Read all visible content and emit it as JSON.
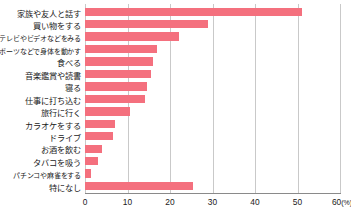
{
  "chart_data": {
    "type": "bar",
    "orientation": "horizontal",
    "title": "",
    "xlabel": "(%)",
    "ylabel": "",
    "xlim": [
      0,
      60
    ],
    "xticks": [
      0,
      10,
      20,
      30,
      40,
      50,
      60
    ],
    "xtick_labels": [
      "0",
      "10",
      "20",
      "30",
      "40",
      "50",
      "60"
    ],
    "unit_label": "(%)",
    "grid": true,
    "legend": false,
    "bar_color": "#F4707E",
    "gridline_color": "#C9C9C9",
    "axis_color": "#8A8A8A",
    "text_color": "#1A1A1A",
    "categories": [
      "家族や友人と話す",
      "買い物をする",
      "テレビやビデオなどをみる",
      "スポーツなどで身体を動かす",
      "食べる",
      "音楽鑑賞や読書",
      "寝る",
      "仕事に打ち込む",
      "旅行に行く",
      "カラオケをする",
      "ドライブ",
      "お酒を飲む",
      "タバコを吸う",
      "パチンコや麻雀をする",
      "特になし"
    ],
    "values": [
      51,
      29,
      22,
      17,
      16,
      15.5,
      14.5,
      14,
      10.5,
      7,
      6.5,
      4,
      3,
      1.5,
      25.5
    ]
  }
}
